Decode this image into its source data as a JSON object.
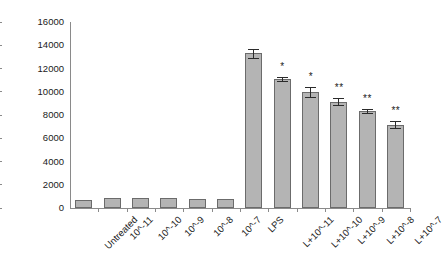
{
  "chart_data": {
    "type": "bar",
    "title": "",
    "xlabel": "",
    "ylabel": "IL-8 (pg/ml)",
    "ylim": [
      0,
      16000
    ],
    "ytick_values": [
      16000,
      14000,
      12000,
      10000,
      8000,
      6000,
      4000,
      2000,
      0
    ],
    "ytick_labels": [
      "16000",
      "14000",
      "12000",
      "10000",
      "8000",
      "6000",
      "4000",
      "2000",
      "0"
    ],
    "grid": false,
    "legend": "none",
    "categories": [
      "Untreated",
      "10^-11",
      "10^-10",
      "10^-9",
      "10^-8",
      "10^-7",
      "LPS",
      "L+10^-11",
      "L+10^-10",
      "L+10^-9",
      "L+10^-8",
      "L+10^-7"
    ],
    "values": [
      700,
      880,
      880,
      870,
      780,
      740,
      13300,
      11100,
      9950,
      9150,
      8350,
      7180
    ],
    "errors": [
      0,
      0,
      0,
      0,
      0,
      0,
      420,
      200,
      420,
      320,
      180,
      320
    ],
    "significance": [
      "",
      "",
      "",
      "",
      "",
      "",
      "",
      "*",
      "*",
      "**",
      "**",
      "**"
    ],
    "bar_color": "#b4b4b4",
    "bar_edge_color": "#6b6b6b",
    "axis_color": "#8a8a8a",
    "error_bar_color": "#2b2b2b"
  }
}
